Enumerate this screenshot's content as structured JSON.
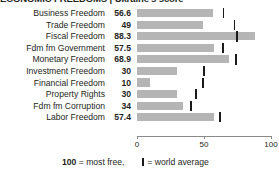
{
  "title": "ECONOMIC FREEDOMS | Ukraine's score",
  "legend": {
    "score_note_number": "100",
    "score_note_text": "= most free,",
    "world_average_text": "= world average",
    "marker_icon": "vertical-bar-icon"
  },
  "axis": {
    "ticks": [
      "0",
      "50",
      "100"
    ],
    "tick_values": [
      0,
      50,
      100
    ],
    "min": 0,
    "max": 100
  },
  "colors": {
    "bar": "#b5b5b5",
    "marker": "#1a1a1a",
    "axis": "#8a8a8a",
    "text": "#231f20"
  },
  "chart_data": {
    "type": "bar",
    "orientation": "horizontal",
    "title": "ECONOMIC FREEDOMS | Ukraine's score",
    "xlabel": "",
    "ylabel": "",
    "xlim": [
      0,
      100
    ],
    "grid": false,
    "legend_position": "bottom",
    "categories": [
      "Business Freedom",
      "Trade Freedom",
      "Fiscal Freedom",
      "Fdm fm Government",
      "Monetary Freedom",
      "Investment Freedom",
      "Financial Freedom",
      "Property Rights",
      "Fdm fm Corruption",
      "Labor Freedom"
    ],
    "series": [
      {
        "name": "Ukraine's score",
        "values": [
          56.6,
          49,
          88.3,
          57.5,
          68.9,
          30,
          10,
          30,
          34,
          57.4
        ]
      },
      {
        "name": "world average",
        "values": [
          64.6,
          72.8,
          74.9,
          64.2,
          74.0,
          50.2,
          49.1,
          44.0,
          40.5,
          62.1
        ]
      }
    ],
    "value_labels": [
      "56.6",
      "49",
      "88.3",
      "57.5",
      "68.9",
      "30",
      "10",
      "30",
      "34",
      "57.4"
    ]
  },
  "rows": [
    {
      "label": "Business Freedom",
      "value": "56.6",
      "score": 56.6,
      "avg": 64.6
    },
    {
      "label": "Trade Freedom",
      "value": "49",
      "score": 49.0,
      "avg": 72.8
    },
    {
      "label": "Fiscal Freedom",
      "value": "88.3",
      "score": 88.3,
      "avg": 74.9
    },
    {
      "label": "Fdm fm Government",
      "value": "57.5",
      "score": 57.5,
      "avg": 64.2
    },
    {
      "label": "Monetary Freedom",
      "value": "68.9",
      "score": 68.9,
      "avg": 74.0
    },
    {
      "label": "Investment Freedom",
      "value": "30",
      "score": 30.0,
      "avg": 50.2
    },
    {
      "label": "Financial Freedom",
      "value": "10",
      "score": 10.0,
      "avg": 49.1
    },
    {
      "label": "Property Rights",
      "value": "30",
      "score": 30.0,
      "avg": 44.0
    },
    {
      "label": "Fdm fm Corruption",
      "value": "34",
      "score": 34.0,
      "avg": 40.5
    },
    {
      "label": "Labor Freedom",
      "value": "57.4",
      "score": 57.4,
      "avg": 62.1
    }
  ]
}
